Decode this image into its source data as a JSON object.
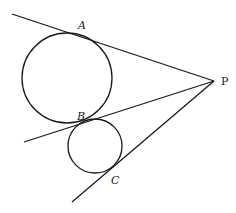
{
  "diagram": {
    "type": "geometry",
    "point_P": {
      "label": "P",
      "x": 214,
      "y": 81
    },
    "lines": [
      {
        "name": "tangent-PA",
        "x1": 12,
        "y1": 14,
        "x2": 214,
        "y2": 81
      },
      {
        "name": "tangent-PB",
        "x1": 24,
        "y1": 142,
        "x2": 214,
        "y2": 81
      },
      {
        "name": "tangent-PC",
        "x1": 72,
        "y1": 202,
        "x2": 214,
        "y2": 81
      }
    ],
    "circles": [
      {
        "name": "large-circle",
        "cx": 67,
        "cy": 78,
        "r": 45
      },
      {
        "name": "small-circle",
        "cx": 95,
        "cy": 146,
        "r": 27
      }
    ],
    "labels": {
      "A": {
        "text": "A",
        "x": 78,
        "y": 29
      },
      "B": {
        "text": "B",
        "x": 77,
        "y": 120
      },
      "C": {
        "text": "C",
        "x": 111,
        "y": 184
      },
      "P": {
        "text": "P",
        "x": 221,
        "y": 85
      }
    },
    "stroke_color": "#1a1a1a"
  }
}
